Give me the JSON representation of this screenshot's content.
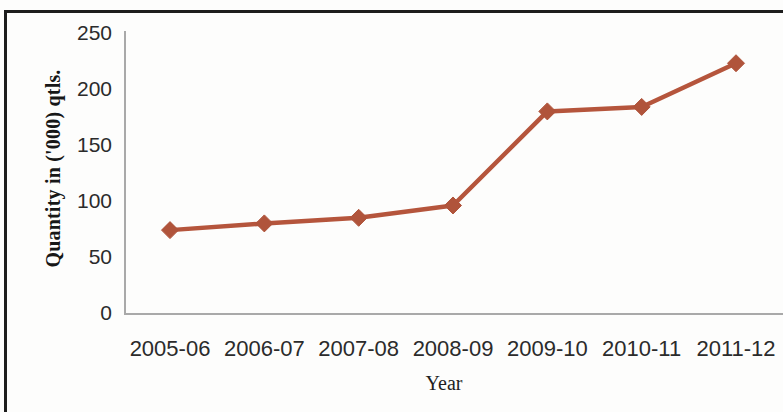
{
  "chart_data": {
    "type": "line",
    "title": "",
    "xlabel": "Year",
    "ylabel": "Quantity in ('000) qtls.",
    "categories": [
      "2005-06",
      "2006-07",
      "2007-08",
      "2008-09",
      "2009-10",
      "2010-11",
      "2011-12"
    ],
    "values": [
      74,
      80,
      85,
      96,
      180,
      184,
      223
    ],
    "series": [
      {
        "name": "Quantity",
        "values": [
          74,
          80,
          85,
          96,
          180,
          184,
          223
        ]
      }
    ],
    "ylim": [
      0,
      250
    ],
    "y_ticks": [
      0,
      50,
      100,
      150,
      200,
      250
    ],
    "y_tick_labels": [
      "0",
      "50",
      "100",
      "150",
      "200",
      "250"
    ],
    "grid": false,
    "legend": false,
    "legend_position": "none",
    "marker": "diamond",
    "colors": {
      "series_line": "#B5553C",
      "series_marker": "#B0543B",
      "axis_line": "#A9A9A9",
      "axis_text": "#2B2B2B",
      "title_text": "#1A1A1A",
      "background": "#FFFFFF",
      "frame": "#1D1D1D"
    }
  }
}
